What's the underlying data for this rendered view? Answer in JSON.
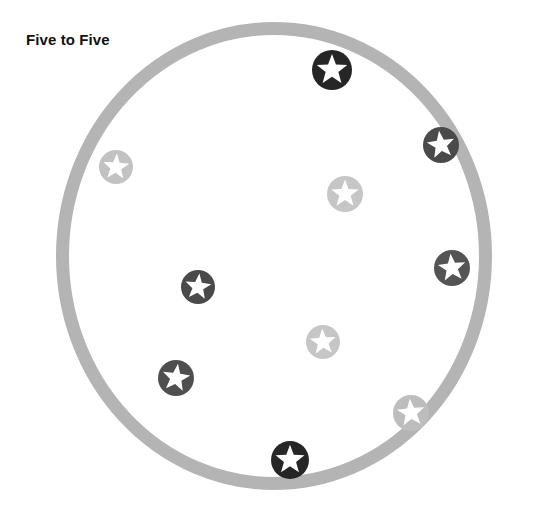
{
  "page": {
    "title": "Five to Five",
    "background_color": "#ffffff"
  },
  "board": {
    "name": "circle-board",
    "shape": "circle",
    "ring_color": "#b4b4b4",
    "ring_thickness": 13,
    "center_x": 274,
    "center_y": 256,
    "radius_x": 218,
    "radius_y": 234,
    "fill": "#ffffff"
  },
  "legend": {
    "dark_token_label": "dark star token",
    "light_token_label": "light star token",
    "dark_count": 5,
    "light_count": 5,
    "total_count": 10
  },
  "colors": {
    "dark_token": "#2b2b2b",
    "dark_token_mid": "#4f4f4f",
    "light_token": "#c0c0c0",
    "star_fill": "#ffffff",
    "ring": "#b4b4b4",
    "title_text": "#111111"
  },
  "tokens": [
    {
      "id": "token-1",
      "name": "star-token-dark-top",
      "type": "dark",
      "color": "#262626",
      "x": 332,
      "y": 70,
      "radius": 20,
      "star_rotation": 0
    },
    {
      "id": "token-2",
      "name": "star-token-dark-upper-right",
      "type": "dark",
      "color": "#4a4a4a",
      "x": 441,
      "y": 145,
      "radius": 18,
      "star_rotation": -8
    },
    {
      "id": "token-3",
      "name": "star-token-light-upper-left",
      "type": "light",
      "color": "#c2c2c2",
      "x": 116,
      "y": 167,
      "radius": 17,
      "star_rotation": 4
    },
    {
      "id": "token-4",
      "name": "star-token-light-upper-center",
      "type": "light",
      "color": "#c6c6c6",
      "x": 345,
      "y": 194,
      "radius": 18,
      "star_rotation": 0
    },
    {
      "id": "token-5",
      "name": "star-token-dark-right",
      "type": "dark",
      "color": "#545454",
      "x": 452,
      "y": 268,
      "radius": 18,
      "star_rotation": -6
    },
    {
      "id": "token-6",
      "name": "star-token-dark-center-left",
      "type": "dark",
      "color": "#4a4a4a",
      "x": 198,
      "y": 287,
      "radius": 17,
      "star_rotation": 6
    },
    {
      "id": "token-7",
      "name": "star-token-light-center",
      "type": "light",
      "color": "#c6c6c6",
      "x": 323,
      "y": 342,
      "radius": 17,
      "star_rotation": -4
    },
    {
      "id": "token-8",
      "name": "star-token-dark-lower-left",
      "type": "dark",
      "color": "#4f4f4f",
      "x": 176,
      "y": 378,
      "radius": 18,
      "star_rotation": 8
    },
    {
      "id": "token-9",
      "name": "star-token-light-lower-right",
      "type": "light",
      "color": "#bdbdbd",
      "x": 411,
      "y": 413,
      "radius": 18,
      "star_rotation": -5
    },
    {
      "id": "token-10",
      "name": "star-token-dark-bottom",
      "type": "dark",
      "color": "#262626",
      "x": 290,
      "y": 460,
      "radius": 19,
      "star_rotation": 0
    }
  ]
}
